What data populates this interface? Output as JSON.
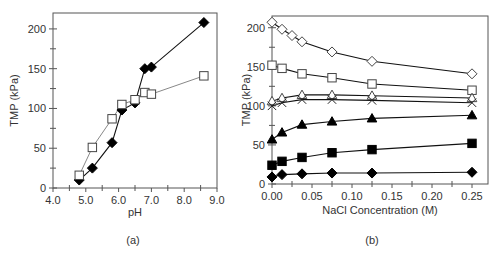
{
  "chart_data": [
    {
      "type": "line",
      "panel_label": "(a)",
      "title": "",
      "xlabel": "pH",
      "ylabel": "TMP (kPa)",
      "xlim": [
        4.0,
        9.0
      ],
      "ylim": [
        0,
        220
      ],
      "xticks": [
        4.0,
        5.0,
        6.0,
        7.0,
        8.0,
        9.0
      ],
      "xtick_labels": [
        "4.0",
        "5.0",
        "6.0",
        "7.0",
        "8.0",
        "9.0"
      ],
      "yticks": [
        0,
        50,
        100,
        150,
        200
      ],
      "ytick_labels": [
        "0",
        "50",
        "100",
        "150",
        "200"
      ],
      "grid": false,
      "legend": null,
      "series": [
        {
          "name": "filled diamond",
          "marker": "diamond-filled",
          "line_color": "#111111",
          "x": [
            4.8,
            5.2,
            5.8,
            6.1,
            6.5,
            6.8,
            7.0,
            8.6
          ],
          "y": [
            10,
            25,
            57,
            98,
            107,
            150,
            152,
            208
          ]
        },
        {
          "name": "open square",
          "marker": "square-open",
          "line_color": "#888888",
          "x": [
            4.8,
            5.2,
            5.8,
            6.1,
            6.5,
            6.8,
            7.0,
            8.6
          ],
          "y": [
            16,
            51,
            87,
            105,
            111,
            120,
            118,
            141
          ]
        }
      ]
    },
    {
      "type": "line",
      "panel_label": "(b)",
      "title": "",
      "xlabel": "NaCl Concentration (M)",
      "ylabel": "TMP (kPa)",
      "xlim": [
        0.0,
        0.27
      ],
      "ylim": [
        0,
        215
      ],
      "xticks": [
        0.0,
        0.05,
        0.1,
        0.15,
        0.2,
        0.25
      ],
      "xtick_labels": [
        "0.00",
        "0.05",
        "0.10",
        "0.15",
        "0.20",
        "0.25"
      ],
      "yticks": [
        0,
        50,
        100,
        150,
        200
      ],
      "ytick_labels": [
        "0",
        "50",
        "100",
        "150",
        "200"
      ],
      "grid": false,
      "legend": null,
      "series": [
        {
          "name": "open diamond",
          "marker": "diamond-open",
          "x": [
            0.0,
            0.0125,
            0.025,
            0.0375,
            0.075,
            0.125,
            0.25
          ],
          "y": [
            207,
            198,
            190,
            182,
            169,
            157,
            141
          ]
        },
        {
          "name": "open square",
          "marker": "square-open",
          "x": [
            0.0,
            0.0125,
            0.0375,
            0.075,
            0.125,
            0.25
          ],
          "y": [
            152,
            148,
            141,
            136,
            128,
            120
          ]
        },
        {
          "name": "open triangle",
          "marker": "triangle-open",
          "x": [
            0.0,
            0.0125,
            0.0375,
            0.075,
            0.125,
            0.25
          ],
          "y": [
            106,
            110,
            114,
            114,
            113,
            110
          ]
        },
        {
          "name": "cross",
          "marker": "x",
          "x": [
            0.0,
            0.0125,
            0.0375,
            0.075,
            0.125,
            0.25
          ],
          "y": [
            100,
            104,
            108,
            108,
            107,
            104
          ]
        },
        {
          "name": "filled triangle",
          "marker": "triangle-filled",
          "x": [
            0.0,
            0.0125,
            0.0375,
            0.075,
            0.125,
            0.25
          ],
          "y": [
            57,
            66,
            76,
            80,
            84,
            88
          ]
        },
        {
          "name": "filled square",
          "marker": "square-filled",
          "x": [
            0.0,
            0.0125,
            0.0375,
            0.075,
            0.125,
            0.25
          ],
          "y": [
            24,
            29,
            34,
            40,
            44,
            52
          ]
        },
        {
          "name": "filled diamond",
          "marker": "diamond-filled",
          "x": [
            0.0,
            0.0125,
            0.0375,
            0.075,
            0.125,
            0.25
          ],
          "y": [
            9,
            12,
            13,
            14,
            14,
            15
          ]
        }
      ]
    }
  ]
}
